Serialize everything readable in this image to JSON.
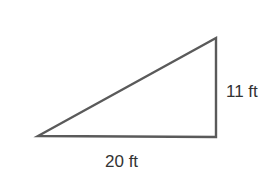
{
  "figure": {
    "shape": "right-triangle",
    "stroke_color": "#5a5a5a",
    "vertices": [
      [
        38,
        136
      ],
      [
        216,
        137
      ],
      [
        216,
        38
      ]
    ],
    "labels": {
      "base": "20 ft",
      "height": "11 ft"
    }
  }
}
